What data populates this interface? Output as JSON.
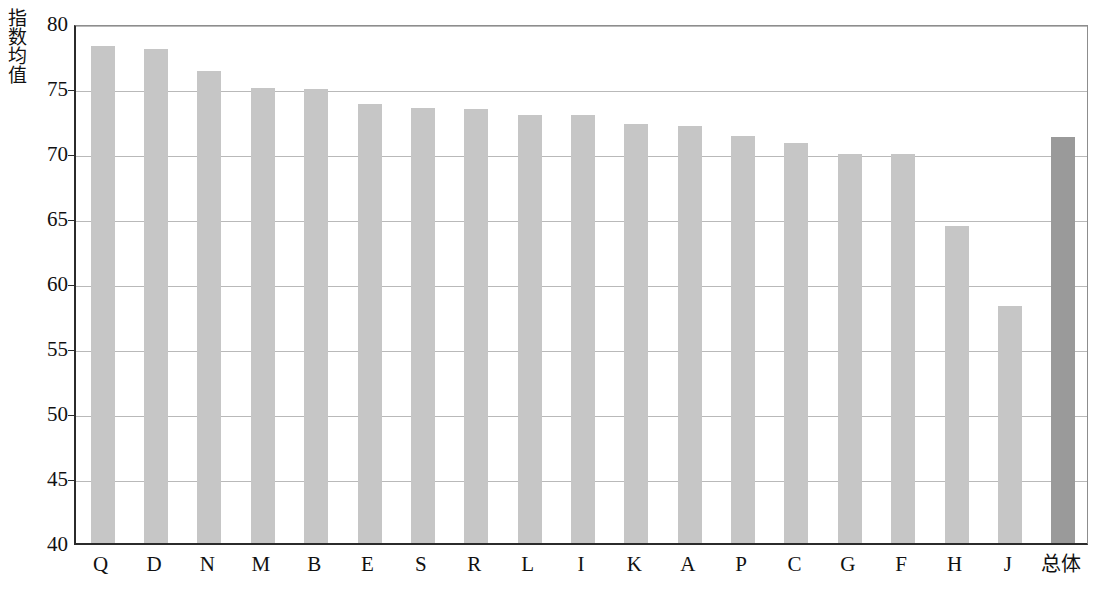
{
  "chart_data": {
    "type": "bar",
    "title": "",
    "xlabel": "",
    "ylabel": "指数均值",
    "ylim": [
      40,
      80
    ],
    "yticks": [
      40,
      45,
      50,
      55,
      60,
      65,
      70,
      75,
      80
    ],
    "ytick_labels": [
      "40",
      "45",
      "50",
      "55",
      "60",
      "65",
      "70",
      "75",
      "80"
    ],
    "grid": true,
    "legend": "none",
    "categories": [
      "Q",
      "D",
      "N",
      "M",
      "B",
      "E",
      "S",
      "R",
      "L",
      "I",
      "K",
      "A",
      "P",
      "C",
      "G",
      "F",
      "H",
      "J",
      "总体"
    ],
    "values": [
      78.2,
      78.0,
      76.3,
      75.0,
      74.9,
      73.8,
      73.5,
      73.4,
      72.9,
      72.9,
      72.2,
      72.1,
      71.3,
      70.8,
      69.9,
      69.9,
      64.4,
      58.2,
      71.2
    ],
    "highlight_index": 18,
    "colors": {
      "bar": "#c6c6c6",
      "bar_highlight": "#9a9a9a",
      "grid": "#b9b9b9",
      "axis": "#2b2b2b",
      "text": "#111111",
      "background": "#ffffff"
    }
  }
}
